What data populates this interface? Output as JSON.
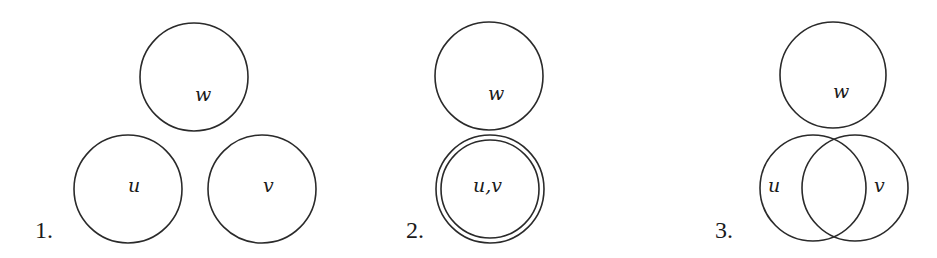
{
  "panels": [
    {
      "number": "1.",
      "description": "three disjoint sets",
      "circles": [
        {
          "label": "w",
          "cx": 194,
          "cy": 77,
          "r": 54
        },
        {
          "label": "u",
          "cx": 128,
          "cy": 189,
          "r": 54
        },
        {
          "label": "v",
          "cx": 262,
          "cy": 189,
          "r": 54
        }
      ]
    },
    {
      "number": "2.",
      "description": "u and v coincide, disjoint from w",
      "circles": [
        {
          "label": "w",
          "cx": 489,
          "cy": 76,
          "r": 54
        },
        {
          "label": "u,v",
          "cx": 490,
          "cy": 189,
          "r": 54,
          "double": true,
          "inner_r": 49
        }
      ]
    },
    {
      "number": "3.",
      "description": "u and v overlap, w disjoint",
      "circles": [
        {
          "label": "w",
          "cx": 833,
          "cy": 75,
          "r": 53
        },
        {
          "label": "u",
          "cx": 813,
          "cy": 188,
          "r": 53
        },
        {
          "label": "v",
          "cx": 855,
          "cy": 188,
          "r": 53
        }
      ]
    }
  ],
  "colors": {
    "stroke": "#2a2a2a",
    "background": "#ffffff"
  }
}
